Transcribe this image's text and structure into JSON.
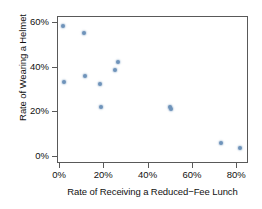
{
  "chart_data": {
    "type": "scatter",
    "title": "",
    "xlabel": "Rate of Receiving a Reduced−Fee Lunch",
    "ylabel": "Rate of Wearing a Helmet",
    "xlim": [
      -2,
      84
    ],
    "ylim": [
      -3,
      65
    ],
    "grid": false,
    "legend": null,
    "point_color": "#6e93ba",
    "axis_color": "#595959",
    "xticks": [
      0,
      20,
      40,
      60,
      80
    ],
    "xtick_labels": [
      "0%",
      "20%",
      "40%",
      "60%",
      "80%"
    ],
    "yticks": [
      0,
      20,
      40,
      60
    ],
    "ytick_labels": [
      "0%",
      "20%",
      "40%",
      "60%"
    ],
    "x": [
      1.8,
      2.3,
      11.3,
      11.7,
      18.6,
      19.0,
      25.4,
      26.6,
      50.2,
      50.6,
      73.2,
      81.7
    ],
    "y": [
      58.0,
      33.2,
      55.0,
      36.0,
      32.3,
      22.0,
      38.4,
      42.2,
      21.8,
      21.1,
      5.6,
      3.4
    ],
    "points": [
      {
        "x": 1.8,
        "y": 58.0
      },
      {
        "x": 2.3,
        "y": 33.2
      },
      {
        "x": 11.3,
        "y": 55.0
      },
      {
        "x": 11.7,
        "y": 36.0
      },
      {
        "x": 18.6,
        "y": 32.3
      },
      {
        "x": 19.0,
        "y": 22.0
      },
      {
        "x": 25.4,
        "y": 38.4
      },
      {
        "x": 26.6,
        "y": 42.2
      },
      {
        "x": 50.2,
        "y": 21.8
      },
      {
        "x": 50.6,
        "y": 21.1
      },
      {
        "x": 73.2,
        "y": 5.6
      },
      {
        "x": 81.7,
        "y": 3.4
      }
    ]
  }
}
